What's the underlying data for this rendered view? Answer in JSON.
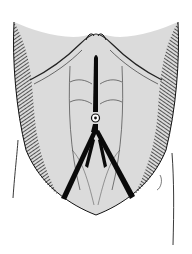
{
  "figure": {
    "background": "#ffffff",
    "ink": "#111111",
    "incision_color": "#0a0a0a",
    "elements": [
      {
        "name": "torso-outline"
      },
      {
        "name": "rib-margin-hatching"
      },
      {
        "name": "rectus-muscles"
      },
      {
        "name": "umbilicus"
      },
      {
        "name": "midline-incision"
      },
      {
        "name": "inverted-y-incision"
      },
      {
        "name": "arm-lines"
      }
    ]
  }
}
